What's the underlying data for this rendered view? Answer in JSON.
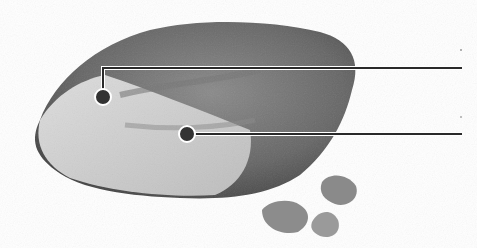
{
  "figure": {
    "callouts": [
      {
        "id": 1,
        "point": [
          103,
          97
        ],
        "line_end_x": 462,
        "line_y": 68,
        "label": ""
      },
      {
        "id": 2,
        "point": [
          187,
          134
        ],
        "line_end_x": 462,
        "line_y": 134,
        "label": ""
      }
    ],
    "colors": {
      "background": "#ffffff",
      "crust": "#6a6a6a",
      "interior": "#cfcfcf",
      "line": "#2a2a2a"
    }
  }
}
